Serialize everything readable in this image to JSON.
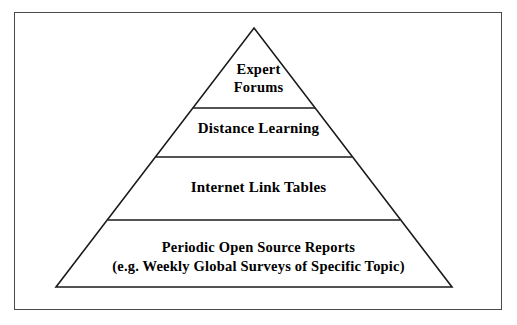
{
  "figure": {
    "type": "pyramid-hierarchy-diagram",
    "background_color": "#ffffff",
    "line_color": "#1a1a1a",
    "frame_color": "#4a4a4a",
    "text_color": "#000000"
  },
  "tiers": [
    {
      "index": 1,
      "position": "apex",
      "lines": [
        "Expert",
        "Forums"
      ]
    },
    {
      "index": 2,
      "position": "upper-middle",
      "lines": [
        "Distance Learning"
      ]
    },
    {
      "index": 3,
      "position": "lower-middle",
      "lines": [
        "Internet Link Tables"
      ]
    },
    {
      "index": 4,
      "position": "base",
      "lines": [
        "Periodic Open Source Reports",
        "(e.g. Weekly Global Surveys of Specific Topic)"
      ]
    }
  ],
  "geometry": {
    "apex": {
      "x": 254,
      "y": 28
    },
    "base_left": {
      "x": 56,
      "y": 287
    },
    "base_right": {
      "x": 452,
      "y": 287
    },
    "dividers": [
      {
        "y": 108,
        "x1": 186,
        "x2": 320
      },
      {
        "y": 157,
        "x1": 151,
        "x2": 355
      },
      {
        "y": 220,
        "x1": 103,
        "x2": 403
      }
    ]
  }
}
